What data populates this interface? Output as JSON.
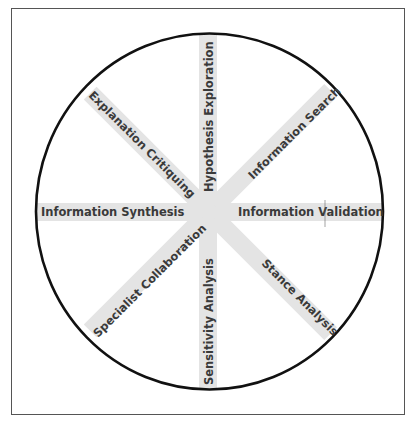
{
  "diagram": {
    "type": "radial-spoke",
    "colors": {
      "spoke": "#e4e4e4",
      "circle": "#111111",
      "text": "#3a3a3a",
      "frame": "#555555"
    },
    "spokes": [
      {
        "label": "Hypothesis Exploration",
        "direction": "north"
      },
      {
        "label": "Information Search",
        "direction": "northeast"
      },
      {
        "label": "Information Validation",
        "direction": "east"
      },
      {
        "label": "Stance Analysis",
        "direction": "southeast"
      },
      {
        "label": "Sensitivity Analysis",
        "direction": "south"
      },
      {
        "label": "Specialist Collaboration",
        "direction": "southwest"
      },
      {
        "label": "Information Synthesis",
        "direction": "west"
      },
      {
        "label": "Explanation Critiquing",
        "direction": "northwest"
      }
    ]
  }
}
